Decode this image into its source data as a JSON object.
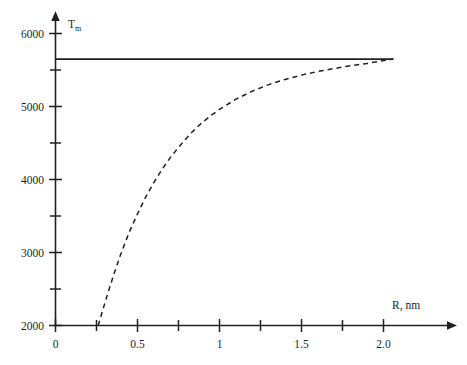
{
  "chart_data": {
    "type": "line",
    "title": "",
    "xlabel": "R, nm",
    "ylabel": "Tm",
    "ylabel_base": "T",
    "ylabel_sub": "m",
    "xlim": [
      0,
      2.06
    ],
    "ylim": [
      2000,
      6180
    ],
    "grid": false,
    "legend": "none",
    "x_ticks_major": [
      0,
      0.5,
      1,
      1.5,
      2.0
    ],
    "x_ticklabels": [
      "0",
      "0.5",
      "1",
      "1.5",
      "2.0"
    ],
    "x_ticks_minor": [
      0.25,
      0.75,
      1.25,
      1.75
    ],
    "y_ticks_major": [
      2000,
      3000,
      4000,
      5000,
      6000
    ],
    "y_ticklabels": [
      "2000",
      "3000",
      "4000",
      "5000",
      "6000"
    ],
    "y_ticks_minor": [
      2500,
      3500,
      4500,
      5500
    ],
    "series": [
      {
        "name": "bulk-melting-temperature",
        "style": "solid",
        "color": "#231f20",
        "x": [
          0,
          2.06
        ],
        "values": [
          5650,
          5650
        ]
      },
      {
        "name": "size-dependent-melting-temperature",
        "style": "dashed",
        "color": "#231f20",
        "x": [
          0.26,
          0.28,
          0.3,
          0.33,
          0.36,
          0.4,
          0.45,
          0.5,
          0.55,
          0.6,
          0.65,
          0.7,
          0.75,
          0.8,
          0.85,
          0.9,
          0.95,
          1.0,
          1.1,
          1.2,
          1.3,
          1.4,
          1.5,
          1.6,
          1.7,
          1.8,
          1.9,
          2.0,
          2.06
        ],
        "values": [
          2000,
          2150,
          2300,
          2520,
          2730,
          2990,
          3280,
          3530,
          3760,
          3960,
          4140,
          4300,
          4440,
          4570,
          4690,
          4790,
          4880,
          4960,
          5100,
          5210,
          5300,
          5370,
          5430,
          5480,
          5520,
          5560,
          5590,
          5630,
          5650
        ]
      }
    ]
  },
  "axes": {
    "y_axis_title": "T",
    "y_axis_subscript": "m",
    "x_axis_title": "R, nm"
  }
}
